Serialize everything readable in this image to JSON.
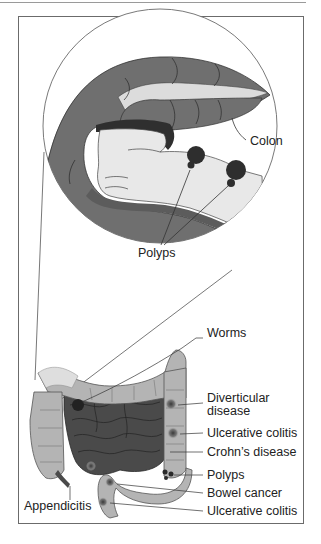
{
  "figure": {
    "type": "anatomical illustration",
    "colors": {
      "colon_dark": "#6f6f6f",
      "colon_light": "#b4b4b4",
      "lumen": "#e6e6e6",
      "small_intestine": "#4a4a4a",
      "polyp": "#2e2e2e",
      "line": "#3a3a3a",
      "frame": "#6b6b6b"
    }
  },
  "magnified_view": {
    "labels": {
      "colon": "Colon",
      "polyps": "Polyps"
    }
  },
  "overview": {
    "labels": {
      "worms": "Worms",
      "diverticular_line1": "Diverticular",
      "diverticular_line2": "disease",
      "ulcerative_colitis_upper": "Ulcerative colitis",
      "crohns": "Crohn’s disease",
      "polyps": "Polyps",
      "bowel_cancer": "Bowel cancer",
      "ulcerative_colitis_lower": "Ulcerative colitis",
      "appendicitis": "Appendicitis"
    }
  }
}
